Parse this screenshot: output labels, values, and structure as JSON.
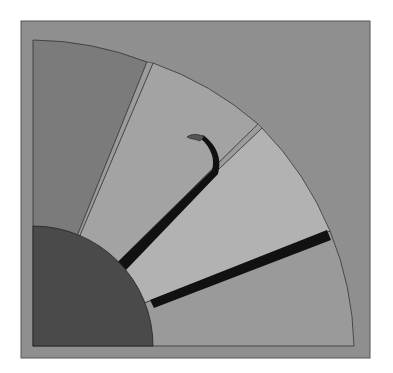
{
  "diagram": {
    "type": "quarter-circle sector diagram",
    "colors": {
      "background": "#ffffff",
      "frame": "#8e8e8e",
      "sector_dark": "#7a7a7a",
      "sector_light": "#a4a4a4",
      "sector_lighter": "#b0b0b0",
      "sector_bottom": "#999999",
      "hub": "#4a4a4a",
      "bars": "#111111",
      "outline": "#333333"
    },
    "sectors": [
      {
        "id": "left-sector",
        "shade": "dark"
      },
      {
        "id": "upper-middle-sector",
        "shade": "light"
      },
      {
        "id": "lower-middle-sector",
        "shade": "lighter"
      },
      {
        "id": "bottom-sector",
        "shade": "medium"
      }
    ],
    "elements": [
      "hub",
      "curved-hook-bar",
      "straight-bar"
    ]
  }
}
